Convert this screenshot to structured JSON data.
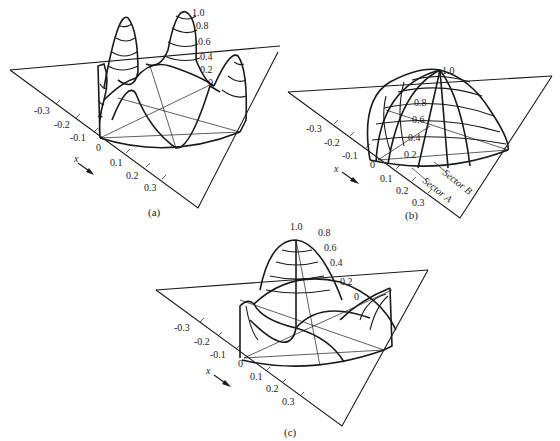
{
  "figure": {
    "panels": [
      {
        "id": "a",
        "caption": "(a)",
        "x_axis_label": "x",
        "x_ticks": [
          "-0.3",
          "-0.2",
          "-0.1",
          "0",
          "0.1",
          "0.2",
          "0.3"
        ],
        "z_ticks": [
          "1.0",
          "0.8",
          "0.6",
          "0.4",
          "0.2",
          "0"
        ],
        "description": "Multi-lobed surface with four peaks on a circular base"
      },
      {
        "id": "b",
        "caption": "(b)",
        "x_axis_label": "x",
        "x_ticks": [
          "-0.3",
          "-0.2",
          "-0.1",
          "0",
          "0.1",
          "0.2",
          "0.3"
        ],
        "z_ticks": [
          "1.0",
          "0.8",
          "0.6",
          "0.4",
          "0.2"
        ],
        "sector_labels": [
          "Sector A",
          "Sector B"
        ],
        "description": "Single dome-shaped surface over circular base"
      },
      {
        "id": "c",
        "caption": "(c)",
        "x_axis_label": "x",
        "x_ticks": [
          "-0.3",
          "-0.2",
          "-0.1",
          "0",
          "0.1",
          "0.2",
          "0.3"
        ],
        "z_ticks": [
          "1.0",
          "0.8",
          "0.6",
          "0.4",
          "0.2",
          "0"
        ],
        "description": "Central peak with side lobes over circular base"
      }
    ]
  }
}
